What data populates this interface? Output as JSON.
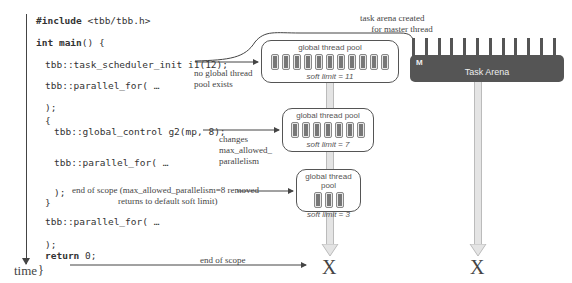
{
  "timeline": {
    "label": "time"
  },
  "code": {
    "line1": "#include <tbb/tbb.h>",
    "line1_kw": "#include",
    "line1_rest": " <tbb/tbb.h>",
    "line2_kw": "int",
    "line2_kw2": "main",
    "line2_rest": "() {",
    "line3": "tbb::task_scheduler_init i1(12);",
    "line4": "tbb::parallel_for( …",
    "line5": ");",
    "line6": "{",
    "line7": "tbb::global_control g2(mp, 8);",
    "line8": "tbb::parallel_for( …",
    "line9": ");",
    "line10": "}",
    "line11": "tbb::parallel_for( …",
    "line12": ");",
    "line13_kw": "return",
    "line13_rest": " 0;",
    "line14": "}"
  },
  "annotations": {
    "no_pool": "no global thread\npool exists",
    "changes": "changes\nmax_allowed_\nparallelism",
    "end_scope_1": "end of scope (max_allowed_parallelism=8 removed",
    "end_scope_1b": "returns to default soft limit)",
    "end_scope_2": "end of scope",
    "arena_created": "task arena created\n     for master thread"
  },
  "pools": [
    {
      "title": "global thread pool",
      "soft_limit": "soft limit = 11",
      "slots": 11
    },
    {
      "title": "global thread pool",
      "soft_limit": "soft limit = 7",
      "slots": 7
    },
    {
      "title": "global thread pool",
      "soft_limit": "soft limit = 3",
      "slots": 3
    }
  ],
  "arena": {
    "label": "Task Arena",
    "master": "M",
    "teeth": 12
  },
  "terminators": {
    "pool_end": "X",
    "arena_end": "X"
  },
  "colors": {
    "arena_fill": "#555555",
    "line": "#444444",
    "shaft": "#e4e4e4"
  }
}
